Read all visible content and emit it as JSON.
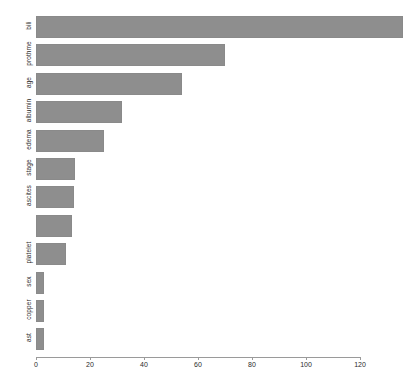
{
  "chart_data": {
    "type": "bar",
    "orientation": "horizontal",
    "title": "",
    "xlabel": "",
    "ylabel": "",
    "xlim": [
      0,
      137
    ],
    "xticks": [
      0,
      20,
      40,
      60,
      80,
      100,
      120
    ],
    "grid": false,
    "legend": null,
    "bar_color": "#8e8e8e",
    "background_color": "#ffffff",
    "categories": [
      "bili",
      "prothme",
      "age",
      "albumin",
      "edema",
      "stage",
      "ascites",
      "",
      "platelet",
      "sex",
      "copper",
      "ast"
    ],
    "values": [
      136,
      70,
      54,
      32,
      25,
      14.5,
      14,
      13.5,
      11,
      3,
      3,
      3
    ],
    "labels_shown": [
      "bili",
      "prothme",
      "age",
      "albumin",
      "edema",
      "stage",
      "ascites",
      "",
      "platelet",
      "sex",
      "copper",
      "ast"
    ]
  },
  "axis": {
    "tick_labels": [
      "0",
      "20",
      "40",
      "60",
      "80",
      "100",
      "120"
    ]
  }
}
